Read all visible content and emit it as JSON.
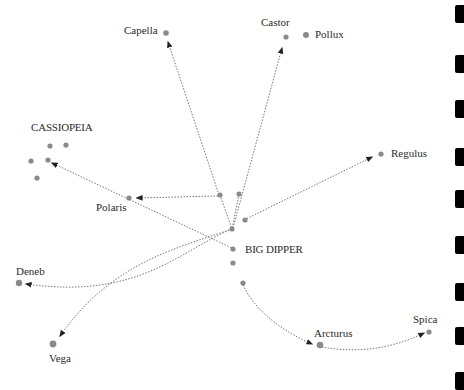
{
  "colors": {
    "star": "#8a8a8a",
    "line": "#777777",
    "arrow": "#222222",
    "text": "#2a2a2a",
    "edge_blocks": "#000000"
  },
  "groups": {
    "big_dipper": {
      "label": "BIG DIPPER"
    },
    "cassiopeia": {
      "label": "CASSIOPEIA"
    }
  },
  "stars": [
    {
      "name": "Capella",
      "label": "Capella"
    },
    {
      "name": "Castor",
      "label": "Castor"
    },
    {
      "name": "Pollux",
      "label": "Pollux"
    },
    {
      "name": "Regulus",
      "label": "Regulus"
    },
    {
      "name": "Polaris",
      "label": "Polaris"
    },
    {
      "name": "Deneb",
      "label": "Deneb"
    },
    {
      "name": "Vega",
      "label": "Vega"
    },
    {
      "name": "Arcturus",
      "label": "Arcturus"
    },
    {
      "name": "Spica",
      "label": "Spica"
    }
  ],
  "edge_blocks": [
    5,
    55,
    100,
    148,
    190,
    236,
    283,
    327,
    372
  ]
}
